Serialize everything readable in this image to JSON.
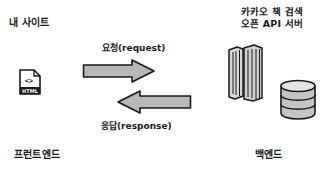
{
  "diagram": {
    "frontend": {
      "site_label": "내 사이트",
      "file_icon": "html-file-icon",
      "file_icon_code_glyph": "<>",
      "file_icon_tag": "HTML",
      "section_label": "프런트엔드"
    },
    "backend": {
      "server_label_line1": "카카오 책 검색",
      "server_label_line2": "오픈 API 서버",
      "server_icon": "server-towers-icon",
      "database_icon": "database-icon",
      "section_label": "백엔드"
    },
    "arrows": {
      "request": {
        "label": "요청(request)",
        "direction": "right"
      },
      "response": {
        "label": "응답(response)",
        "direction": "left"
      }
    },
    "colors": {
      "background": "#ffffff",
      "ink": "#1a1a1a",
      "arrow_fill": "#b8b8b8",
      "server_fill": "#d0d0d0",
      "database_fill": "#c4c4c4"
    }
  }
}
